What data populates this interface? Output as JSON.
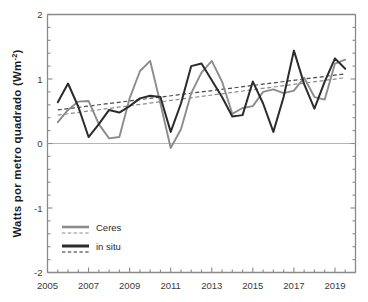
{
  "chart_data": {
    "type": "line",
    "title": "",
    "xlabel": "",
    "ylabel": "Watts por metro quadrado (Wm",
    "ylabel_sup": "-2",
    "ylabel_suffix": ")",
    "xlim": [
      2005,
      2020
    ],
    "ylim": [
      -2,
      2
    ],
    "yticks": [
      2,
      1,
      0,
      -1,
      -2
    ],
    "ytick_labels": [
      "2",
      "1",
      "0",
      "-1",
      "-2"
    ],
    "xticks": [
      2005,
      2007,
      2009,
      2011,
      2013,
      2015,
      2017,
      2019
    ],
    "xtick_labels": [
      "2005",
      "2007",
      "2009",
      "2011",
      "2013",
      "2015",
      "2017",
      "2019"
    ],
    "xminor_step": 0.5,
    "yminor_step": 0.2,
    "grid": false,
    "zero_line": 0,
    "legend_position": "bottom-left",
    "colors": {
      "ceres": "#8c8c8c",
      "in_situ": "#2b2b2b",
      "axis": "#8a8a8a",
      "zero_line": "#b5b5b5",
      "background": "#ffffff"
    },
    "series": [
      {
        "name": "Ceres",
        "color": "#8c8c8c",
        "style": "solid",
        "x": [
          2005.5,
          2006.0,
          2006.5,
          2007.0,
          2007.5,
          2008.0,
          2008.5,
          2009.0,
          2009.5,
          2010.0,
          2010.5,
          2011.0,
          2011.5,
          2012.0,
          2012.5,
          2013.0,
          2013.5,
          2014.0,
          2014.5,
          2015.0,
          2015.5,
          2016.0,
          2016.5,
          2017.0,
          2017.5,
          2018.0,
          2018.5,
          2019.0,
          2019.5
        ],
        "y": [
          0.33,
          0.52,
          0.65,
          0.66,
          0.3,
          0.08,
          0.1,
          0.7,
          1.12,
          1.28,
          0.62,
          -0.07,
          0.22,
          0.78,
          1.1,
          1.28,
          0.96,
          0.46,
          0.55,
          0.58,
          0.8,
          0.84,
          0.78,
          0.82,
          1.02,
          0.72,
          0.68,
          1.24,
          1.3
        ]
      },
      {
        "name": "in situ",
        "color": "#2b2b2b",
        "style": "solid",
        "x": [
          2005.5,
          2006.0,
          2006.5,
          2007.0,
          2007.5,
          2008.0,
          2008.5,
          2009.0,
          2009.5,
          2010.0,
          2010.5,
          2011.0,
          2011.5,
          2012.0,
          2012.5,
          2013.0,
          2013.5,
          2014.0,
          2014.5,
          2015.0,
          2015.5,
          2016.0,
          2016.5,
          2017.0,
          2017.5,
          2018.0,
          2018.5,
          2019.0,
          2019.5
        ],
        "y": [
          0.64,
          0.93,
          0.57,
          0.1,
          0.3,
          0.52,
          0.48,
          0.58,
          0.7,
          0.74,
          0.72,
          0.18,
          0.62,
          1.2,
          1.24,
          0.98,
          0.72,
          0.42,
          0.44,
          0.96,
          0.62,
          0.18,
          0.72,
          1.44,
          0.92,
          0.54,
          0.96,
          1.32,
          1.16
        ]
      }
    ],
    "trend_lines": [
      {
        "name": "Ceres trend",
        "color": "#8c8c8c",
        "style": "dashed",
        "x": [
          2005.5,
          2019.5
        ],
        "y": [
          0.44,
          1.02
        ]
      },
      {
        "name": "in situ trend",
        "color": "#4a4a4a",
        "style": "dashed",
        "x": [
          2005.5,
          2019.5
        ],
        "y": [
          0.52,
          1.08
        ]
      }
    ],
    "legend": [
      {
        "label": "Ceres",
        "color": "#8c8c8c"
      },
      {
        "label": "in situ",
        "color": "#2b2b2b"
      }
    ]
  }
}
